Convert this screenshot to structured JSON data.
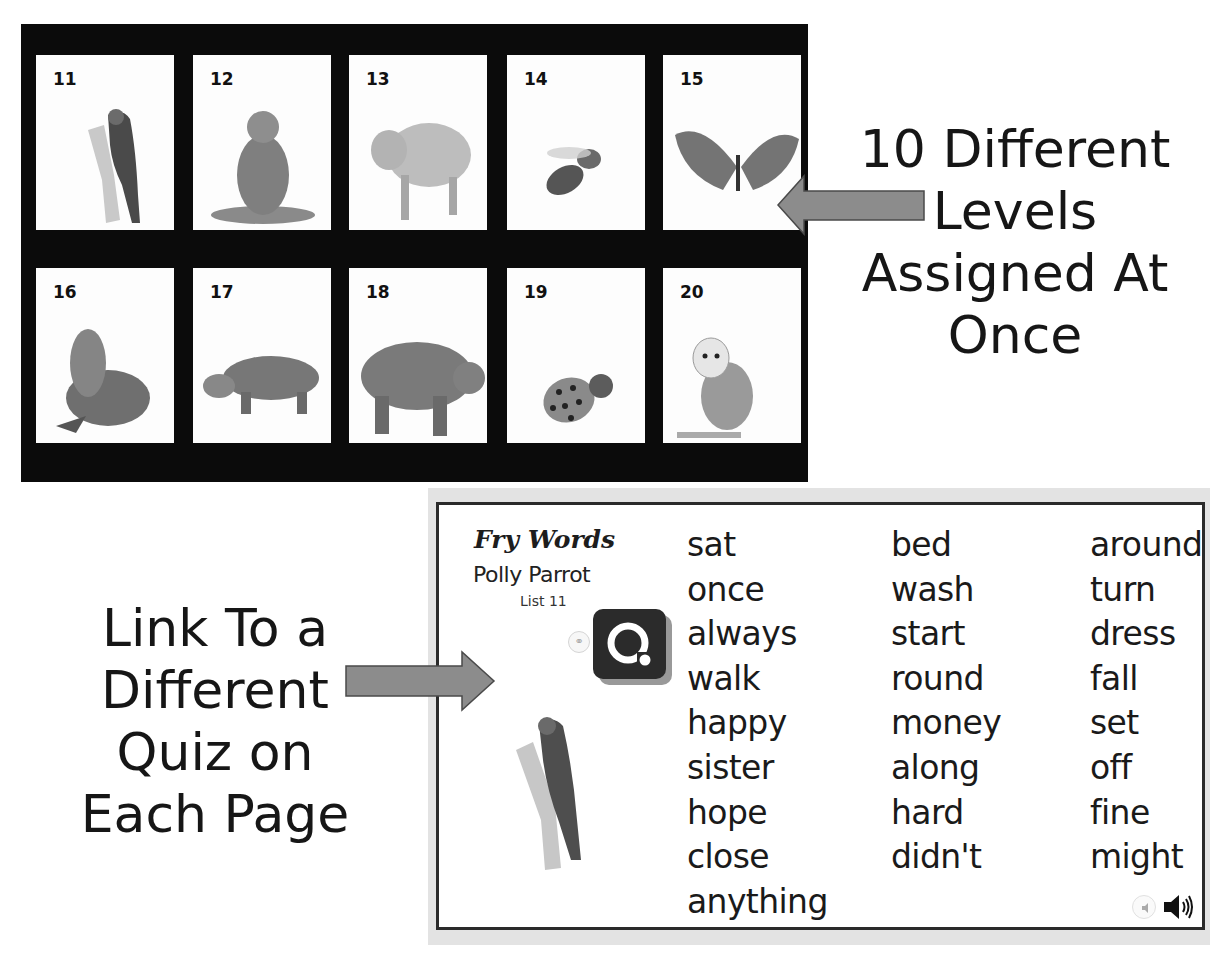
{
  "level_board": {
    "cards": [
      {
        "number": "11",
        "animal": "parrot"
      },
      {
        "number": "12",
        "animal": "monkey"
      },
      {
        "number": "13",
        "animal": "pig"
      },
      {
        "number": "14",
        "animal": "bee"
      },
      {
        "number": "15",
        "animal": "butterfly"
      },
      {
        "number": "16",
        "animal": "seal"
      },
      {
        "number": "17",
        "animal": "hippo"
      },
      {
        "number": "18",
        "animal": "bear"
      },
      {
        "number": "19",
        "animal": "ladybug"
      },
      {
        "number": "20",
        "animal": "owl"
      }
    ]
  },
  "callouts": {
    "top": [
      "10 Different",
      "Levels",
      "Assigned At",
      "Once"
    ],
    "left": [
      "Link To a",
      "Different",
      "Quiz on",
      "Each Page"
    ]
  },
  "quiz_page": {
    "title": "Fry Words",
    "subtitle": "Polly Parrot",
    "list_label": "List 11",
    "quiz_icon": "quizizz-q-icon",
    "link_icon": "link-icon",
    "audio_icon": "speaker-icon",
    "columns": [
      [
        "sat",
        "once",
        "always",
        "walk",
        "happy",
        "sister",
        "hope",
        "close",
        "anything"
      ],
      [
        "bed",
        "wash",
        "start",
        "round",
        "money",
        "along",
        "hard",
        "didn't"
      ],
      [
        "around",
        "turn",
        "dress",
        "fall",
        "set",
        "off",
        "fine",
        "might"
      ]
    ]
  },
  "colors": {
    "board_bg": "#0b0b0b",
    "card_bg": "#fdfdfd",
    "arrow_fill": "#8c8c8c",
    "arrow_stroke": "#4a4a4a",
    "frame_bg": "#e3e3e3"
  }
}
